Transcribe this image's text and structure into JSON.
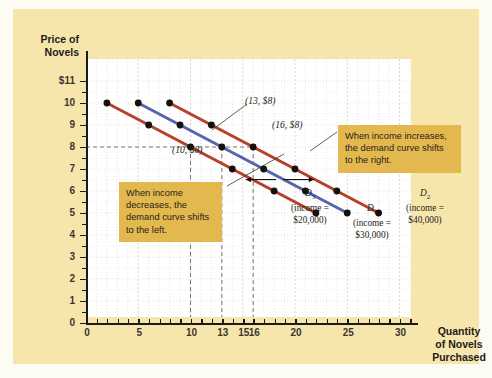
{
  "figure": {
    "background_color": "#f7e6ac",
    "plot_background": "#ffffff",
    "callout_color": "#e3b84e"
  },
  "axes": {
    "y_title_line1": "Price of",
    "y_title_line2": "Novels",
    "x_title_line1": "Quantity",
    "x_title_line2": "of Novels",
    "x_title_line3": "Purchased",
    "y_ticks": [
      "$11",
      "10",
      "9",
      "8",
      "7",
      "6",
      "5",
      "4",
      "3",
      "2",
      "1",
      "0"
    ],
    "x_ticks": [
      "0",
      "5",
      "10",
      "13",
      "15",
      "16",
      "20",
      "25",
      "30"
    ]
  },
  "callouts": [
    {
      "id": "increase",
      "text": "When income increases, the demand curve shifts to the right."
    },
    {
      "id": "decrease",
      "text": "When income decreases, the demand curve shifts to the left."
    }
  ],
  "point_labels": [
    {
      "id": "p10",
      "text": "(10, $8)"
    },
    {
      "id": "p13",
      "text": "(13, $8)"
    },
    {
      "id": "p16",
      "text": "(16, $8)"
    }
  ],
  "curve_labels": [
    {
      "name": "D3",
      "symbol": "D",
      "sub": "3",
      "income_line1": "(income =",
      "income_line2": "$20,000)"
    },
    {
      "name": "D1",
      "symbol": "D",
      "sub": "1",
      "income_line1": "(income =",
      "income_line2": "$30,000)"
    },
    {
      "name": "D2",
      "symbol": "D",
      "sub": "2",
      "income_line1": "(income =",
      "income_line2": "$40,000)"
    }
  ],
  "chart_data": {
    "type": "line",
    "title": "",
    "xlabel": "Quantity of Novels Purchased",
    "ylabel": "Price of Novels",
    "xlim": [
      0,
      32
    ],
    "ylim": [
      0,
      11.5
    ],
    "grid": true,
    "legend_position": "inline-right",
    "series": [
      {
        "name": "D3",
        "label": "D3 (income = $20,000)",
        "color": "#b5412a",
        "points": [
          [
            2,
            10
          ],
          [
            6,
            9
          ],
          [
            10,
            8
          ],
          [
            14,
            7
          ],
          [
            18,
            6
          ],
          [
            22,
            5
          ]
        ]
      },
      {
        "name": "D1",
        "label": "D1 (income = $30,000)",
        "color": "#5566ad",
        "points": [
          [
            5,
            10
          ],
          [
            9,
            9
          ],
          [
            13,
            8
          ],
          [
            17,
            7
          ],
          [
            21,
            6
          ],
          [
            25,
            5
          ]
        ]
      },
      {
        "name": "D2",
        "label": "D2 (income = $40,000)",
        "color": "#b5412a",
        "points": [
          [
            8,
            10
          ],
          [
            12,
            9
          ],
          [
            16,
            8
          ],
          [
            20,
            7
          ],
          [
            24,
            6
          ],
          [
            28,
            5
          ]
        ]
      }
    ],
    "reference_lines": [
      {
        "orientation": "horizontal",
        "value": 8,
        "style": "dashed"
      },
      {
        "orientation": "vertical",
        "value": 10,
        "style": "dashed"
      },
      {
        "orientation": "vertical",
        "value": 13,
        "style": "dashed"
      },
      {
        "orientation": "vertical",
        "value": 16,
        "style": "dashed"
      }
    ],
    "annotations": [
      {
        "text": "(10, $8)",
        "x": 10,
        "y": 8
      },
      {
        "text": "(13, $8)",
        "x": 13,
        "y": 8
      },
      {
        "text": "(16, $8)",
        "x": 16,
        "y": 8
      },
      {
        "text": "When income increases, the demand curve shifts to the right.",
        "x": 24,
        "y": 7.6
      },
      {
        "text": "When income decreases, the demand curve shifts to the left.",
        "x": 5.5,
        "y": 4.8
      }
    ],
    "arrows": [
      {
        "direction": "left",
        "x": 16,
        "y": 6.5
      },
      {
        "direction": "right",
        "x": 19,
        "y": 6.5
      }
    ]
  }
}
